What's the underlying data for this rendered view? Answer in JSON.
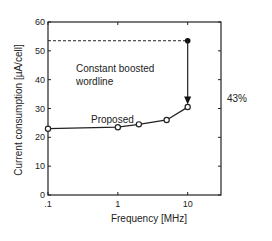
{
  "chart_data": {
    "type": "line",
    "title": "",
    "xlabel": "Frequency [MHz]",
    "ylabel": "Current consumption [µA/cell]",
    "xscale": "log",
    "xlim": [
      0.1,
      30
    ],
    "ylim": [
      0,
      60
    ],
    "xticks": [
      0.1,
      1,
      10
    ],
    "xtick_labels": [
      ".1",
      "1",
      "10"
    ],
    "yticks": [
      0,
      10,
      20,
      30,
      40,
      50,
      60
    ],
    "ytick_labels": [
      "0",
      "10",
      "20",
      "30",
      "40",
      "50",
      "60"
    ],
    "grid": false,
    "series": [
      {
        "name": "Proposed",
        "marker": "open-circle",
        "x": [
          0.1,
          1,
          2,
          5,
          10
        ],
        "y": [
          23,
          23.5,
          24.5,
          26,
          30.5
        ]
      },
      {
        "name": "Constant boosted wordline",
        "marker": "filled-circle",
        "style": "dashed",
        "x": [
          0.1,
          10
        ],
        "y": [
          53.5,
          53.5
        ]
      }
    ],
    "annotations": [
      {
        "text": "Constant boosted",
        "line2": "wordline"
      },
      {
        "text": "Proposed"
      },
      {
        "text": "43%",
        "arrow_from": [
          10,
          53.5
        ],
        "arrow_to": [
          10,
          31
        ]
      }
    ]
  }
}
